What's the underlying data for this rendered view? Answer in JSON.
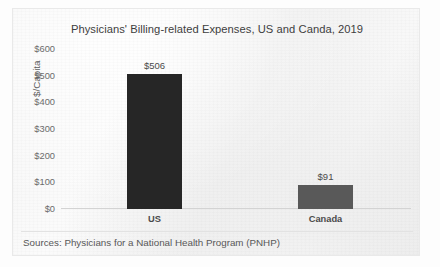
{
  "chart_data": {
    "type": "bar",
    "title": "Physicians' Billing-related Expenses, US and Canda, 2019",
    "categories": [
      "US",
      "Canada"
    ],
    "values": [
      506,
      91
    ],
    "data_labels": [
      "$506",
      "$91"
    ],
    "xlabel": "",
    "ylabel": "$/Capita",
    "ylim": [
      0,
      600
    ],
    "ytick_labels": [
      "$600",
      "$500",
      "$400",
      "$300",
      "$200",
      "$100",
      "$0"
    ],
    "ytick_values": [
      600,
      500,
      400,
      300,
      200,
      100,
      0
    ],
    "grid": false,
    "legend": "none",
    "bar_colors": [
      "#262626",
      "#595959"
    ],
    "source": "Sources: Physicians for a National Health Program (PNHP)"
  },
  "colors": {
    "title_text": "#3e3e3e",
    "axis_text": "#6b6b6b",
    "axis_line": "#d3d3d3",
    "page_background": "#f6f6f6",
    "us_bar": "#262626",
    "canada_bar": "#595959"
  }
}
